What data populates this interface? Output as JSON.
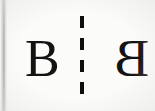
{
  "figure": {
    "kind": "mirror-symmetry-illustration",
    "caption": "",
    "background_color": "#fbfbfa",
    "ink_color": "#131313",
    "letters": {
      "original": {
        "character": "B",
        "label": "original-letter",
        "orientation": "upright"
      },
      "mirrored": {
        "character": "B",
        "label": "mirrored-letter",
        "orientation": "horizontally-flipped",
        "cropped": "right edge"
      }
    },
    "axis": {
      "label": "mirror-line",
      "style": "dashed",
      "orientation": "vertical",
      "dash_count": "4",
      "color": "#0e0e0e"
    },
    "page_edge": {
      "label": "scan-gutter-edge",
      "color": "#8f8f8f"
    }
  }
}
